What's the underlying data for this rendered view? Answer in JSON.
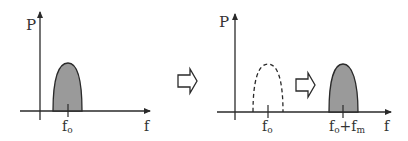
{
  "colors": {
    "stroke": "#2a2a2a",
    "fill": "#9a9a9a",
    "background": "#ffffff"
  },
  "left_plot": {
    "y_axis_label": "P",
    "x_axis_label": "f",
    "tick_label_base": "f",
    "tick_label_sub": "o",
    "spectrum_style": "filled"
  },
  "transition_arrow_1": {
    "icon": "hollow-right-arrow-icon"
  },
  "right_plot": {
    "y_axis_label": "P",
    "x_axis_label": "f",
    "original_tick_base": "f",
    "original_tick_sub": "o",
    "original_spectrum_style": "dashed",
    "shifted_tick_base": "f",
    "shifted_tick_sub": "o",
    "shifted_tick_plus": "+f",
    "shifted_tick_sub2": "m",
    "shifted_spectrum_style": "filled"
  },
  "transition_arrow_2": {
    "icon": "hollow-right-arrow-icon"
  }
}
